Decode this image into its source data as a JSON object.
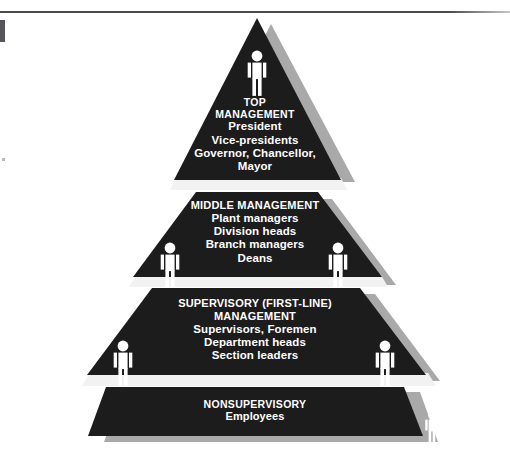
{
  "page": {
    "corner_marker": "1",
    "background_color": "#ffffff",
    "rule_color": "#4a4a4a"
  },
  "diagram": {
    "type": "management-pyramid",
    "tier_fill_color": "#1c1c1c",
    "tier_shadow_color": "#a9a9a9",
    "text_color": "#ffffff",
    "figure_color": "#ffffff",
    "tiers": [
      {
        "id": "top-management",
        "heading": [
          "TOP",
          "MANAGEMENT"
        ],
        "lines": [
          "President",
          "Vice-presidents",
          "Governor, Chancellor,",
          "Mayor"
        ],
        "figure_count": 1,
        "figures": [
          {
            "x": 257,
            "y": 30,
            "scale": 1.0
          }
        ]
      },
      {
        "id": "middle-management",
        "heading": [
          "MIDDLE MANAGEMENT"
        ],
        "lines": [
          "Plant managers",
          "Division heads",
          "Branch managers",
          "Deans"
        ],
        "figure_count": 2,
        "figures": [
          {
            "x": 170,
            "y": 203,
            "scale": 1.0
          },
          {
            "x": 338,
            "y": 203,
            "scale": 1.0
          }
        ]
      },
      {
        "id": "supervisory-management",
        "heading": [
          "SUPERVISORY (FIRST-LINE)",
          "MANAGEMENT"
        ],
        "lines": [
          "Supervisors, Foremen",
          "Department heads",
          "Section leaders"
        ],
        "figure_count": 2,
        "figures": [
          {
            "x": 123,
            "y": 300,
            "scale": 1.0
          },
          {
            "x": 385,
            "y": 300,
            "scale": 1.0
          }
        ]
      },
      {
        "id": "nonsupervisory",
        "heading": [
          "NONSUPERVISORY"
        ],
        "lines": [
          "Employees"
        ],
        "figure_count": 2,
        "figures": [
          {
            "x": 76,
            "y": 394,
            "scale": 0.72
          },
          {
            "x": 432,
            "y": 394,
            "scale": 0.72
          }
        ]
      }
    ]
  }
}
